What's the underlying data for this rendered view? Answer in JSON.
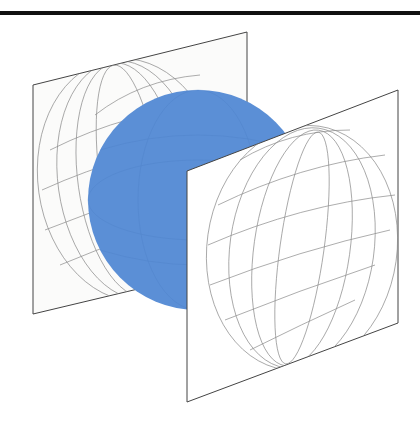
{
  "figure": {
    "colors": {
      "sphere": "#5b8fd6",
      "sphere_edge": "#6e9fe0",
      "plane_fill": "#fbfbfa",
      "plane_stroke": "#444444",
      "grid_stroke": "#8a8a8a",
      "rule": "#111111"
    },
    "elements": [
      {
        "id": "back-plane",
        "type": "plane",
        "corners": [
          [
            33,
            85
          ],
          [
            247,
            32
          ],
          [
            247,
            263
          ],
          [
            33,
            314
          ]
        ]
      },
      {
        "id": "sphere",
        "type": "sphere",
        "cx": 195,
        "cy": 191,
        "r": 110
      },
      {
        "id": "front-plane",
        "type": "plane",
        "corners": [
          [
            187,
            171
          ],
          [
            398,
            90
          ],
          [
            398,
            323
          ],
          [
            187,
            402
          ]
        ]
      }
    ]
  }
}
